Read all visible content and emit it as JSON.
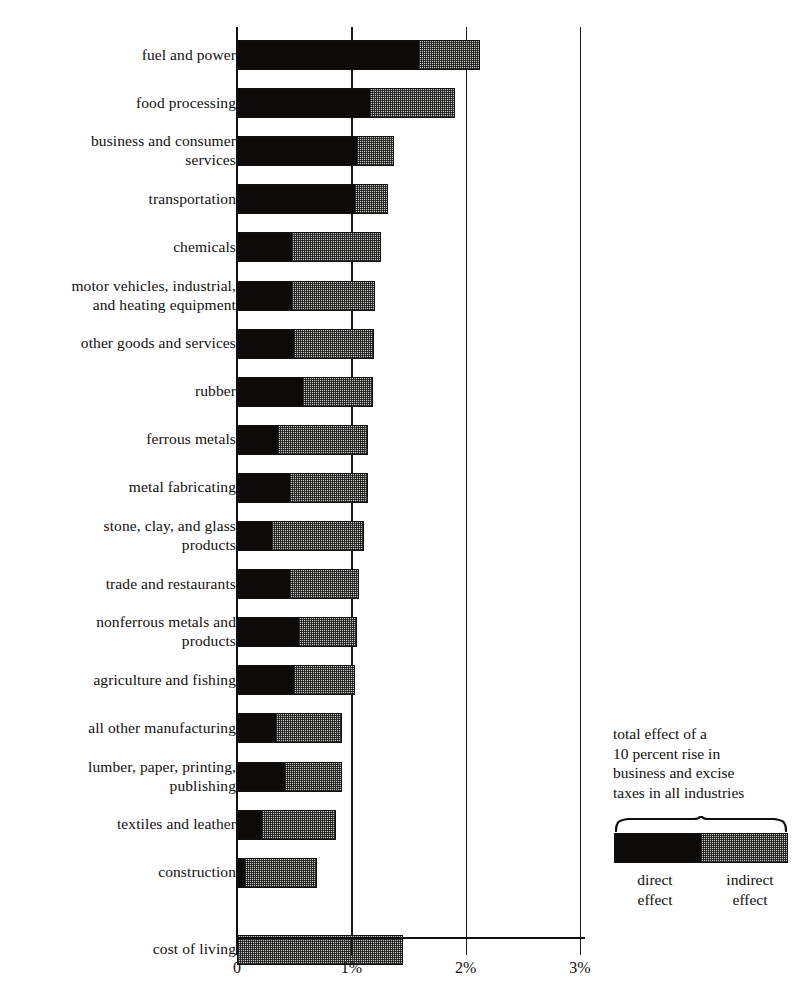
{
  "chart_data": {
    "type": "bar",
    "orientation": "horizontal",
    "stacked": true,
    "title": "",
    "xlabel": "",
    "ylabel": "",
    "xlim": [
      0,
      3.1
    ],
    "grid": true,
    "legend_position": "right-bottom",
    "xticks": [
      {
        "value": 0,
        "label": "0"
      },
      {
        "value": 1,
        "label": "1%"
      },
      {
        "value": 2,
        "label": "2%"
      },
      {
        "value": 3,
        "label": "3%"
      }
    ],
    "series": [
      {
        "name": "direct effect",
        "color": "#0c0b0a"
      },
      {
        "name": "indirect effect",
        "color": "#c9c9c4"
      }
    ],
    "categories": [
      "fuel and power",
      "food processing",
      "business and consumer\nservices",
      "transportation",
      "chemicals",
      "motor vehicles, industrial,\nand heating equipment",
      "other goods and services",
      "rubber",
      "ferrous metals",
      "metal fabricating",
      "stone, clay, and glass\nproducts",
      "trade and restaurants",
      "nonferrous metals and\nproducts",
      "agriculture and fishing",
      "all other manufacturing",
      "lumber, paper, printing,\npublishing",
      "textiles and leather",
      "construction",
      "cost of  living"
    ],
    "rows": [
      {
        "label": "fuel and power",
        "direct": 1.59,
        "indirect": 0.54,
        "total": 2.13
      },
      {
        "label": "food processing",
        "direct": 1.16,
        "indirect": 0.75,
        "total": 1.91
      },
      {
        "label": "business and consumer\nservices",
        "direct": 1.05,
        "indirect": 0.32,
        "total": 1.37
      },
      {
        "label": "transportation",
        "direct": 1.03,
        "indirect": 0.29,
        "total": 1.32
      },
      {
        "label": "chemicals",
        "direct": 0.48,
        "indirect": 0.78,
        "total": 1.26
      },
      {
        "label": "motor vehicles, industrial,\nand heating equipment",
        "direct": 0.48,
        "indirect": 0.73,
        "total": 1.21
      },
      {
        "label": "other goods and services",
        "direct": 0.5,
        "indirect": 0.7,
        "total": 1.2
      },
      {
        "label": "rubber",
        "direct": 0.58,
        "indirect": 0.61,
        "total": 1.19
      },
      {
        "label": "ferrous metals",
        "direct": 0.36,
        "indirect": 0.79,
        "total": 1.15
      },
      {
        "label": "metal fabricating",
        "direct": 0.46,
        "indirect": 0.69,
        "total": 1.15
      },
      {
        "label": "stone, clay, and glass\nproducts",
        "direct": 0.31,
        "indirect": 0.8,
        "total": 1.11
      },
      {
        "label": "trade and restaurants",
        "direct": 0.46,
        "indirect": 0.61,
        "total": 1.07
      },
      {
        "label": "nonferrous metals and\nproducts",
        "direct": 0.54,
        "indirect": 0.51,
        "total": 1.05
      },
      {
        "label": "agriculture and fishing",
        "direct": 0.5,
        "indirect": 0.53,
        "total": 1.03
      },
      {
        "label": "all other manufacturing",
        "direct": 0.34,
        "indirect": 0.58,
        "total": 0.92
      },
      {
        "label": "lumber, paper, printing,\npublishing",
        "direct": 0.42,
        "indirect": 0.5,
        "total": 0.92
      },
      {
        "label": "textiles and leather",
        "direct": 0.22,
        "indirect": 0.65,
        "total": 0.87
      },
      {
        "label": "construction",
        "direct": 0.07,
        "indirect": 0.63,
        "total": 0.7
      },
      {
        "label": "cost of  living",
        "direct": 0.0,
        "indirect": 1.45,
        "total": 1.45
      }
    ]
  },
  "axis": {
    "tick_labels": [
      "0",
      "1%",
      "2%",
      "3%"
    ]
  },
  "legend": {
    "caption": "total effect of a\n10 percent rise in\nbusiness and excise\ntaxes in all industries",
    "direct_label": "direct\neffect",
    "indirect_label": "indirect\neffect"
  }
}
